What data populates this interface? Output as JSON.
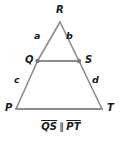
{
  "figure": {
    "type": "geometry-diagram",
    "shape": "triangle-with-midsegment",
    "line_color": "#8c8c8c",
    "label_color": "#1a1a1a",
    "background": "#ffffff",
    "vertices": [
      {
        "name": "R",
        "label": "R",
        "x": 60,
        "y": 22,
        "label_x": 56,
        "label_y": 5,
        "dot": false
      },
      {
        "name": "Q",
        "label": "Q",
        "x": 37.5,
        "y": 61,
        "label_x": 25,
        "label_y": 55,
        "dot": true
      },
      {
        "name": "S",
        "label": "S",
        "x": 79,
        "y": 61,
        "label_x": 85,
        "label_y": 55,
        "dot": true
      },
      {
        "name": "P",
        "label": "P",
        "x": 16,
        "y": 109,
        "label_x": 5,
        "label_y": 103,
        "dot": false
      },
      {
        "name": "T",
        "label": "T",
        "x": 102,
        "y": 109,
        "label_x": 107,
        "label_y": 103,
        "dot": false
      }
    ],
    "segments": [
      {
        "name": "RQ",
        "from": "R",
        "to": "Q"
      },
      {
        "name": "RS",
        "from": "R",
        "to": "S"
      },
      {
        "name": "QS",
        "from": "Q",
        "to": "S"
      },
      {
        "name": "QP",
        "from": "Q",
        "to": "P"
      },
      {
        "name": "ST",
        "from": "S",
        "to": "T"
      },
      {
        "name": "PT",
        "from": "P",
        "to": "T"
      }
    ],
    "side_labels": [
      {
        "name": "a",
        "label": "a",
        "on_segment": "RQ",
        "x": 34,
        "y": 31
      },
      {
        "name": "b",
        "label": "b",
        "on_segment": "RS",
        "x": 66,
        "y": 31
      },
      {
        "name": "c",
        "label": "c",
        "on_segment": "QP",
        "x": 14,
        "y": 75
      },
      {
        "name": "d",
        "label": "d",
        "on_segment": "ST",
        "x": 92,
        "y": 75
      }
    ],
    "caption": {
      "segment_one": "QS",
      "relation": "∥",
      "segment_two": "PT",
      "full_text": "QS ∥ PT"
    }
  }
}
